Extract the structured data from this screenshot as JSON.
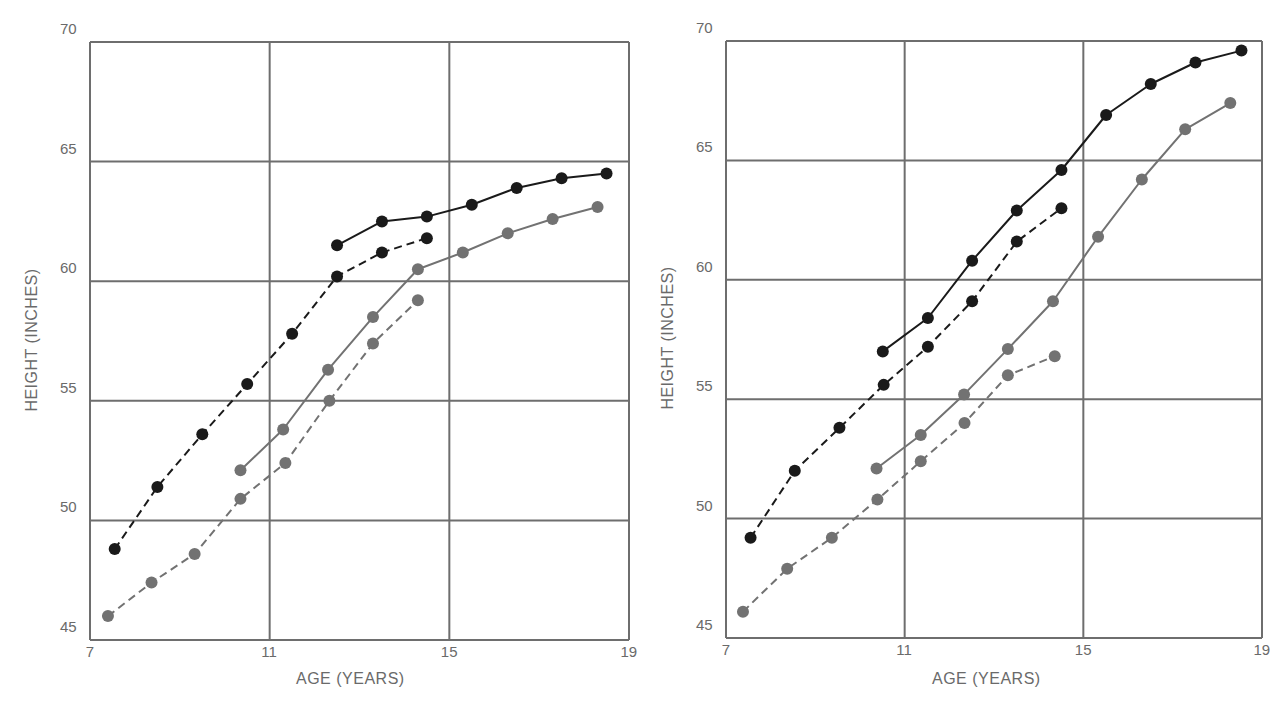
{
  "chart_data": [
    {
      "type": "line",
      "panel": "left",
      "title": "",
      "xlabel": "AGE (YEARS)",
      "ylabel": "HEIGHT (INCHES)",
      "xlim": [
        7,
        19
      ],
      "ylim": [
        45,
        70
      ],
      "xticks": [
        7,
        11,
        15,
        19
      ],
      "yticks": [
        45,
        50,
        55,
        60,
        65,
        70
      ],
      "grid": true,
      "legend": null,
      "series": [
        {
          "name": "black-dashed",
          "color": "#1a1a1a",
          "style": "dashed",
          "x": [
            7.55,
            8.5,
            9.5,
            10.5,
            11.5,
            12.5,
            13.5,
            14.5
          ],
          "y": [
            48.8,
            51.4,
            53.6,
            55.7,
            57.8,
            60.2,
            61.2,
            61.8
          ]
        },
        {
          "name": "black-solid",
          "color": "#1a1a1a",
          "style": "solid",
          "x": [
            12.5,
            13.5,
            14.5,
            15.5,
            16.5,
            17.5,
            18.5
          ],
          "y": [
            61.5,
            62.5,
            62.7,
            63.2,
            63.9,
            64.3,
            64.5
          ]
        },
        {
          "name": "gray-solid",
          "color": "#727272",
          "style": "solid",
          "x": [
            10.35,
            11.3,
            12.3,
            13.3,
            14.3,
            15.3,
            16.3,
            17.3,
            18.3
          ],
          "y": [
            52.1,
            53.8,
            56.3,
            58.5,
            60.5,
            61.2,
            62.0,
            62.6,
            63.1
          ]
        },
        {
          "name": "gray-dashed",
          "color": "#727272",
          "style": "dashed",
          "x": [
            7.4,
            8.37,
            9.33,
            10.35,
            11.35,
            12.33,
            13.3,
            14.3
          ],
          "y": [
            46.0,
            47.4,
            48.6,
            50.9,
            52.4,
            55.0,
            57.4,
            59.2
          ]
        }
      ]
    },
    {
      "type": "line",
      "panel": "right",
      "title": "",
      "xlabel": "AGE (YEARS)",
      "ylabel": "HEIGHT (INCHES)",
      "xlim": [
        7,
        19
      ],
      "ylim": [
        45,
        70
      ],
      "xticks": [
        7,
        11,
        15,
        19
      ],
      "yticks": [
        45,
        50,
        55,
        60,
        65,
        70
      ],
      "grid": true,
      "legend": null,
      "series": [
        {
          "name": "black-dashed",
          "color": "#1a1a1a",
          "style": "dashed",
          "x": [
            7.55,
            8.54,
            9.54,
            10.53,
            11.52,
            12.51,
            13.51,
            14.51
          ],
          "y": [
            49.2,
            52.0,
            53.8,
            55.6,
            57.2,
            59.1,
            61.6,
            63.0
          ]
        },
        {
          "name": "black-solid",
          "color": "#1a1a1a",
          "style": "solid",
          "x": [
            10.51,
            11.52,
            12.51,
            13.51,
            14.51,
            15.51,
            16.51,
            17.51,
            18.54
          ],
          "y": [
            57.0,
            58.4,
            60.8,
            62.9,
            64.6,
            66.9,
            68.2,
            69.1,
            69.6
          ]
        },
        {
          "name": "gray-solid",
          "color": "#727272",
          "style": "solid",
          "x": [
            10.37,
            11.36,
            12.33,
            13.31,
            14.32,
            15.33,
            16.31,
            17.28,
            18.29
          ],
          "y": [
            52.1,
            53.5,
            55.2,
            57.1,
            59.1,
            61.8,
            64.2,
            66.3,
            67.4
          ]
        },
        {
          "name": "gray-dashed",
          "color": "#727272",
          "style": "dashed",
          "x": [
            7.38,
            8.37,
            9.37,
            10.39,
            11.36,
            12.34,
            13.31,
            14.36
          ],
          "y": [
            46.1,
            47.9,
            49.2,
            50.8,
            52.4,
            54.0,
            56.0,
            56.8
          ]
        }
      ]
    }
  ],
  "panels": {
    "left": {
      "xlabel": "AGE (YEARS)",
      "ylabel": "HEIGHT (INCHES)"
    },
    "right": {
      "xlabel": "AGE (YEARS)",
      "ylabel": "HEIGHT (INCHES)"
    }
  },
  "colors": {
    "grid": "#6e6e6e",
    "text": "#6a6a6a",
    "black_series": "#1a1a1a",
    "gray_series": "#727272"
  }
}
